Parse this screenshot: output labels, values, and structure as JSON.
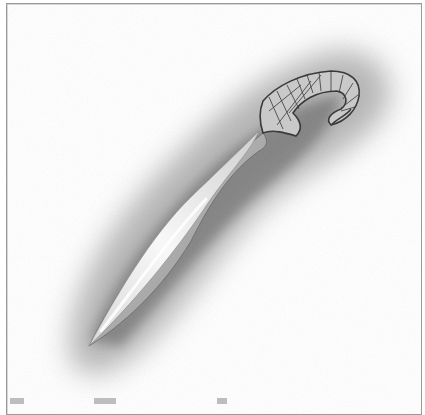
{
  "image": {
    "subject": "pencil illustration of a curved bronze-age sickle sword",
    "style": "grayscale pencil drawing with smudged shadow",
    "colors": {
      "frame_border": "#9a9a9a",
      "background": "#ffffff",
      "shadow": "#6e6e6e",
      "blade_light": "#f4f4f4",
      "blade_mid": "#bdbdbd",
      "wrap_line": "#3a3a3a"
    }
  },
  "caption": {
    "visible": "cropped",
    "text": ""
  }
}
